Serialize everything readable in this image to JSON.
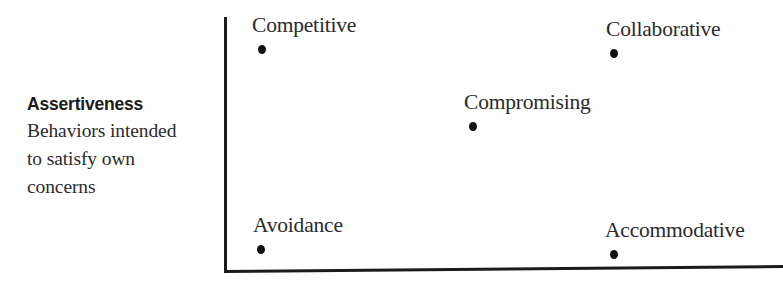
{
  "diagram": {
    "background_color": "#fefefe",
    "ink_color": "#1b1b1b",
    "text_color": "#2b2b2b",
    "axis": {
      "vertical": {
        "name": "assertiveness-axis",
        "caption_title": "Assertiveness",
        "caption_lines": [
          "Behaviors intended",
          "to satisfy own",
          "concerns"
        ]
      },
      "horizontal": {
        "name": "cooperativeness-axis",
        "caption_title": "",
        "caption_lines": []
      }
    },
    "nodes": [
      {
        "id": "competitive",
        "label": "Competitive",
        "dot_x": 258,
        "dot_y": 45,
        "label_x": 252,
        "label_y": 36
      },
      {
        "id": "collaborative",
        "label": "Collaborative",
        "dot_x": 610,
        "dot_y": 49,
        "label_x": 606,
        "label_y": 40
      },
      {
        "id": "compromising",
        "label": "Compromising",
        "dot_x": 469,
        "dot_y": 122,
        "label_x": 464,
        "label_y": 113
      },
      {
        "id": "avoidance",
        "label": "Avoidance",
        "dot_x": 257,
        "dot_y": 245,
        "label_x": 253,
        "label_y": 236
      },
      {
        "id": "accommodative",
        "label": "Accommodative",
        "dot_x": 610,
        "dot_y": 250,
        "label_x": 605,
        "label_y": 241
      }
    ]
  },
  "chart_data": {
    "type": "scatter",
    "xlabel": "",
    "ylabel": "Assertiveness",
    "ylabel_description": "Behaviors intended to satisfy own concerns",
    "grid": false,
    "legend": "none",
    "xlim": [
      0,
      1
    ],
    "ylim": [
      0,
      1
    ],
    "points": [
      {
        "label": "Competitive",
        "x": 0.06,
        "y": 0.92
      },
      {
        "label": "Collaborative",
        "x": 0.69,
        "y": 0.9
      },
      {
        "label": "Compromising",
        "x": 0.44,
        "y": 0.61
      },
      {
        "label": "Avoidance",
        "x": 0.06,
        "y": 0.11
      },
      {
        "label": "Accommodative",
        "x": 0.69,
        "y": 0.09
      }
    ]
  }
}
